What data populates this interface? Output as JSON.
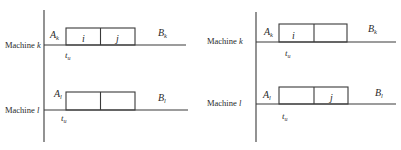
{
  "diagrams": [
    {
      "id": "left",
      "machines": [
        {
          "label": "Machine",
          "var": "k",
          "start_label": "A",
          "start_sub": "k",
          "end_label": "B",
          "end_sub": "k",
          "time_label": "t",
          "time_sub": "u",
          "jobs": [
            "i",
            "j"
          ]
        },
        {
          "label": "Machine",
          "var": "l",
          "start_label": "A",
          "start_sub": "l",
          "end_label": "B",
          "end_sub": "l",
          "time_label": "t",
          "time_sub": "u",
          "jobs": [
            "",
            ""
          ]
        }
      ]
    },
    {
      "id": "right",
      "machines": [
        {
          "label": "Machine",
          "var": "k",
          "start_label": "A",
          "start_sub": "k",
          "end_label": "B",
          "end_sub": "k",
          "time_label": "t",
          "time_sub": "u",
          "jobs": [
            "i",
            ""
          ]
        },
        {
          "label": "Machine",
          "var": "l",
          "start_label": "A",
          "start_sub": "l",
          "end_label": "B",
          "end_sub": "l",
          "time_label": "t",
          "time_sub": "u",
          "jobs": [
            "",
            "j"
          ]
        }
      ]
    }
  ]
}
